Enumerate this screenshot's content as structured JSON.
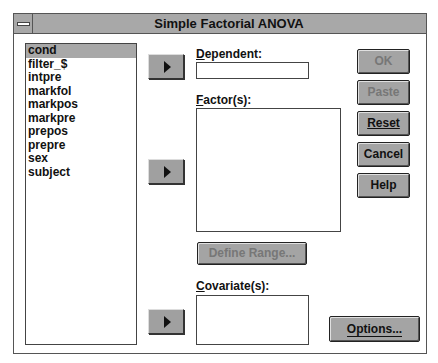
{
  "window": {
    "title": "Simple Factorial ANOVA"
  },
  "variables": {
    "items": [
      "cond",
      "filter_$",
      "intpre",
      "markfol",
      "markpos",
      "markpre",
      "prepos",
      "prepre",
      "sex",
      "subject"
    ],
    "selected_index": 0
  },
  "dependent": {
    "label_prefix": "D",
    "label_rest": "ependent:",
    "value": ""
  },
  "factors": {
    "label_prefix": "F",
    "label_rest": "actor(s):",
    "items": []
  },
  "define_range": {
    "label": "Define Range...",
    "enabled": false
  },
  "covariates": {
    "label_prefix": "C",
    "label_rest": "ovariate(s):",
    "items": []
  },
  "buttons": {
    "ok": {
      "label": "OK",
      "enabled": false
    },
    "paste": {
      "label": "Paste",
      "enabled": false
    },
    "reset": {
      "label": "Reset",
      "enabled": true
    },
    "cancel": {
      "label": "Cancel",
      "enabled": true
    },
    "help": {
      "label": "Help",
      "enabled": true
    },
    "options": {
      "label": "Options...",
      "enabled": true
    }
  },
  "arrow_icons": [
    "move-to-dependent",
    "move-to-factors",
    "move-to-covariates"
  ]
}
